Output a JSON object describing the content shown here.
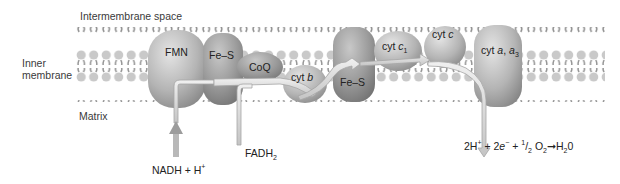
{
  "labels": {
    "intermembrane_space": "Intermembrane space",
    "inner_membrane_line1": "Inner",
    "inner_membrane_line2": "membrane",
    "matrix": "Matrix"
  },
  "complexes": [
    {
      "id": "fmn",
      "label": "FMN"
    },
    {
      "id": "fe-s-1",
      "label": "Fe–S"
    },
    {
      "id": "coq",
      "label": "CoQ"
    },
    {
      "id": "cyt-b",
      "label_prefix": "cyt ",
      "label_italic": "b"
    },
    {
      "id": "fe-s-2",
      "label": "Fe–S"
    },
    {
      "id": "cyt-c1",
      "label_prefix": "cyt ",
      "label_italic": "c",
      "label_sub": "1"
    },
    {
      "id": "cyt-c",
      "label_prefix": "cyt ",
      "label_italic": "c"
    },
    {
      "id": "cyt-a-a3",
      "label_prefix": "cyt ",
      "label_italic": "a",
      "label_mid": ", ",
      "label_italic2": "a",
      "label_sub": "3"
    }
  ],
  "inputs": {
    "nadh": {
      "main": "NADH + H",
      "sup": "+"
    },
    "fadh2": {
      "main": "FADH",
      "sub": "2"
    }
  },
  "reaction": {
    "part1": "2H",
    "sup1": "+",
    "part2": " + 2",
    "e": "e",
    "sup2": "−",
    "part3": " + ",
    "half_num": "1",
    "half_den": "2",
    "o": " O",
    "o_sub": "2",
    "arrow": "➞",
    "h": "H",
    "h_sub": "2",
    "tail": "0"
  },
  "colors": {
    "protein_light": "#d4d4d4",
    "protein_dark": "#8e8e8e",
    "lipid_head": "#c8c8c8",
    "lipid_tail": "#8a8a8a",
    "arrow_fill": "#e2e2e2",
    "arrow_stroke": "#a8a8a8"
  }
}
